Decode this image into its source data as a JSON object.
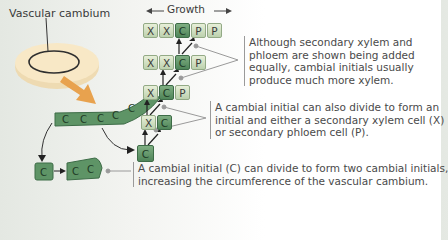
{
  "labels": {
    "vascular_cambium": "Vascular cambium",
    "growth": "Growth"
  },
  "rows": [
    {
      "cells": [
        "X",
        "X",
        "C",
        "P",
        "P"
      ]
    },
    {
      "cells": [
        "X",
        "X",
        "C",
        "P"
      ]
    },
    {
      "cells": [
        "X",
        "C",
        "P"
      ]
    },
    {
      "cells": [
        "X",
        "C"
      ]
    },
    {
      "cells": [
        "C"
      ]
    }
  ],
  "curve_cells": [
    "C",
    "C",
    "C",
    "C",
    "C"
  ],
  "bottom_cells": [
    "C",
    "C",
    "C"
  ],
  "annotations": {
    "top": {
      "line1": "Although secondary xylem and",
      "line2": "phloem are shown being added",
      "line3": "equally, cambial initials usually",
      "line4": "produce much more xylem."
    },
    "middle": {
      "line1": "A cambial initial can also divide to form an",
      "line2": "initial and either a secondary xylem cell (X)",
      "line3": "or secondary phloem cell (P)."
    },
    "bottom": {
      "line1": "A cambial initial (C) can divide to form two cambial initials,",
      "line2": "increasing the circumference of the vascular cambium."
    }
  },
  "colors": {
    "cambial_cell": "#5e9466",
    "xylem_phloem_cell": "#cfdfc0",
    "ring": "#f2d9a8",
    "arrow_fill": "#e8a24e"
  }
}
